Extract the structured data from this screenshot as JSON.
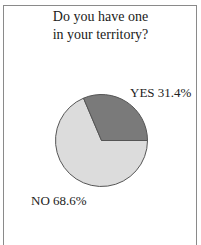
{
  "figure": {
    "title_lines": [
      "Do you have one",
      "in your territory?"
    ]
  },
  "colors": {
    "yes_slice": "#7a7a7a",
    "no_slice": "#dcdcdc",
    "slice_stroke": "#555555",
    "frame": "#8a8a8a"
  },
  "labels": {
    "yes": "YES 31.4%",
    "no": "NO 68.6%"
  },
  "chart_data": {
    "type": "pie",
    "title": "Do you have one in your territory?",
    "categories": [
      "YES",
      "NO"
    ],
    "values": [
      31.4,
      68.6
    ],
    "unit": "%",
    "start_angle_deg": 0,
    "direction": "counterclockwise",
    "labels": [
      "YES 31.4%",
      "NO 68.6%"
    ],
    "legend": "none (direct labels)",
    "geometry": {
      "cx": 101.5,
      "cy": 140.5,
      "r": 46
    }
  }
}
